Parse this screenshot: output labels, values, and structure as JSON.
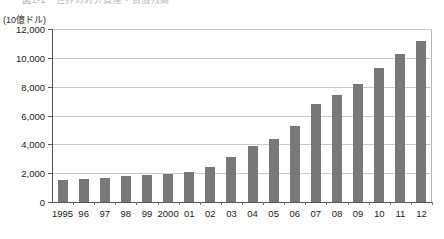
{
  "figure": {
    "title_fragment": "図1-1　世界の対外資産・負債残高",
    "unit_caption": "(10億ドル)"
  },
  "chart_data": {
    "type": "bar",
    "title": "図1-1　世界の対外資産・負債残高",
    "xlabel": "",
    "ylabel": "(10億ドル)",
    "unit": "10億ドル",
    "ylim": [
      0,
      12000
    ],
    "ytick_step": 2000,
    "yticks": [
      0,
      2000,
      4000,
      6000,
      8000,
      10000,
      12000
    ],
    "ytick_labels": [
      "0",
      "2,000",
      "4,000",
      "6,000",
      "8,000",
      "10,000",
      "12,000"
    ],
    "grid": true,
    "grid_axis": "y",
    "legend": null,
    "bar_color": "#787878",
    "categories": [
      "1995",
      "96",
      "97",
      "98",
      "99",
      "2000",
      "01",
      "02",
      "03",
      "04",
      "05",
      "06",
      "07",
      "08",
      "09",
      "10",
      "11",
      "12"
    ],
    "values": [
      1550,
      1600,
      1650,
      1800,
      1900,
      1950,
      2100,
      2400,
      3100,
      3900,
      4400,
      5300,
      6800,
      7400,
      8200,
      9300,
      10300,
      11200
    ]
  }
}
